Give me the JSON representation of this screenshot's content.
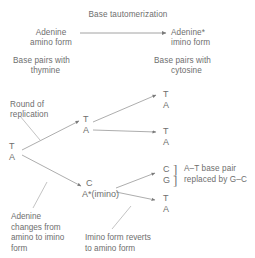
{
  "figure": {
    "title": "Base tautomerization",
    "left_species": {
      "line1": "Adenine",
      "line2": "amino form"
    },
    "right_species": {
      "line1": "Adenine*",
      "line2": "imino form"
    },
    "left_pairing": {
      "line1": "Base pairs with",
      "line2": "thymine"
    },
    "right_pairing": {
      "line1": "Base pairs with",
      "line2": "cytosine"
    },
    "replication_label": {
      "line1": "Round of",
      "line2": "replication"
    },
    "amino_to_imino_note": "Adenine changes from amino to imino form",
    "imino_reverts_note": "Imino form reverts to amino form",
    "outcome_note": {
      "line1": "A–T base pair",
      "line2": "replaced by G–C"
    },
    "bracket_open": "]",
    "bases": {
      "parent_top": "T",
      "parent_bottom": "A",
      "fork_top": "T",
      "fork_bottom": "A",
      "prog1_top": "T",
      "prog1_bottom": "A",
      "prog2_top": "T",
      "prog2_bottom": "A",
      "mut_top": "C",
      "mut_bottom_label": "A*(imino)",
      "prog3_top": "C",
      "prog3_bottom": "G",
      "prog4_top": "T",
      "prog4_bottom": "A"
    },
    "colors": {
      "text": "#6e6e6e",
      "stroke": "#8a8a8a",
      "background": "#ffffff"
    }
  }
}
